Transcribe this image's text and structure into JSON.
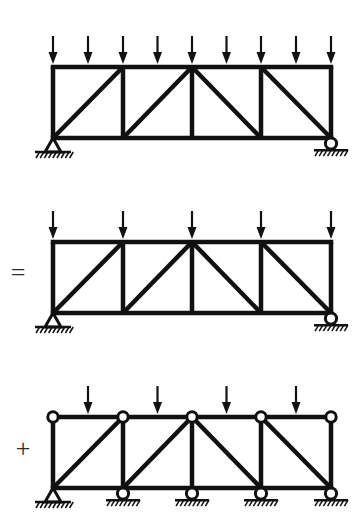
{
  "figure": {
    "background_color": "#ffffff",
    "ink_color": "#111111",
    "width": 362,
    "height": 528
  },
  "operators": [
    {
      "name": "equals",
      "symbol": "=",
      "x": 18,
      "y": 281
    },
    {
      "name": "plus",
      "symbol": "+",
      "x": 23,
      "y": 457
    }
  ],
  "geometry": {
    "left_x": 53,
    "right_x": 331,
    "panel_node_x": [
      53,
      123,
      192,
      261,
      331
    ],
    "mid_panel_x": [
      88,
      157.5,
      226.5,
      296
    ],
    "truss_depth": 71,
    "chord_stroke": 4.5,
    "web_stroke": 4.5,
    "arrow_length": 28,
    "arrow_head_width": 9,
    "arrow_head_length": 12,
    "diagonal_pattern": [
      "up",
      "up",
      "down",
      "down"
    ]
  },
  "diagrams": [
    {
      "name": "combined-loaded-truss",
      "label": "Uniformly loaded truss with pin and roller supports",
      "top_chord_y": 67,
      "bottom_chord_y": 138,
      "arrow_count": 9,
      "arrow_x": [
        53,
        88,
        123,
        157.5,
        192,
        226.5,
        261,
        296,
        331
      ],
      "arrow_tip_y": 64,
      "supports": [
        {
          "type": "pin",
          "x": 53,
          "y": 138
        },
        {
          "type": "roller",
          "x": 331,
          "y": 138
        }
      ],
      "top_joints": [],
      "bottom_joints": []
    },
    {
      "name": "panel-point-load-truss",
      "label": "Truss with loads applied at panel points only",
      "top_chord_y": 242,
      "bottom_chord_y": 313,
      "arrow_count": 5,
      "arrow_x": [
        53,
        123,
        192,
        261,
        331
      ],
      "arrow_tip_y": 239,
      "supports": [
        {
          "type": "pin",
          "x": 53,
          "y": 313
        },
        {
          "type": "roller",
          "x": 331,
          "y": 313
        }
      ],
      "top_joints": [],
      "bottom_joints": []
    },
    {
      "name": "local-bending-truss",
      "label": "Top chord as continuous beam with hinges and intermediate supports",
      "top_chord_y": 417,
      "bottom_chord_y": 488,
      "arrow_count": 4,
      "arrow_x": [
        88,
        157.5,
        226.5,
        296
      ],
      "arrow_tip_y": 414,
      "supports": [
        {
          "type": "pin",
          "x": 53,
          "y": 488
        },
        {
          "type": "roller",
          "x": 123,
          "y": 488
        },
        {
          "type": "roller",
          "x": 192,
          "y": 488
        },
        {
          "type": "roller",
          "x": 261,
          "y": 488
        },
        {
          "type": "roller",
          "x": 331,
          "y": 488
        }
      ],
      "top_joints": [
        {
          "type": "hinge",
          "x": 53
        },
        {
          "type": "hinge",
          "x": 123
        },
        {
          "type": "hinge",
          "x": 192
        },
        {
          "type": "hinge",
          "x": 261
        },
        {
          "type": "hinge",
          "x": 331
        }
      ],
      "bottom_joints": []
    }
  ]
}
